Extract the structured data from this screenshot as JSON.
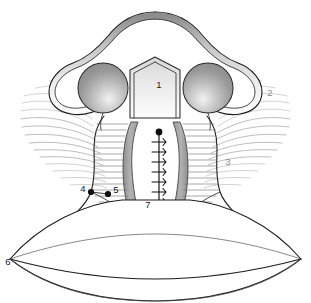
{
  "figure": {
    "background_color": "#ffffff",
    "width": 311,
    "height": 303,
    "view": "coronal / frontal schematic",
    "line_color": "#1c1c1c",
    "fill_white": "#ffffff",
    "fill_gray_band": "#a8a8a8",
    "fill_gray_lobe": "#9c9c9c",
    "striation_color": "#9a9a9a",
    "faint_label_color": "#8c8c8c"
  },
  "callouts": [
    {
      "id": "1",
      "label": "1",
      "x": 159,
      "y": 85,
      "style": "dark",
      "has_dot": false,
      "has_leader": false,
      "region": "central-pentagon-septum"
    },
    {
      "id": "2",
      "label": "2",
      "x": 270,
      "y": 93,
      "style": "faint",
      "has_dot": false,
      "has_leader": false,
      "region": "right-upper-striations"
    },
    {
      "id": "3",
      "label": "3",
      "x": 228,
      "y": 162,
      "style": "faint",
      "has_dot": false,
      "has_leader": false,
      "region": "right-lower-striations"
    },
    {
      "id": "4",
      "label": "4",
      "x": 83,
      "y": 189,
      "style": "dark",
      "has_dot": true,
      "dot_x": 91,
      "dot_y": 192,
      "has_leader": true,
      "region": "left-junction-point"
    },
    {
      "id": "5",
      "label": "5",
      "x": 116,
      "y": 190,
      "style": "dark",
      "has_dot": true,
      "dot_x": 108,
      "dot_y": 194,
      "has_leader": true,
      "region": "medial-junction-point"
    },
    {
      "id": "6",
      "label": "6",
      "x": 8,
      "y": 262,
      "style": "dark",
      "has_dot": false,
      "has_leader": false,
      "region": "left-lens-vertex"
    },
    {
      "id": "7",
      "label": "7",
      "x": 148,
      "y": 205,
      "style": "dark",
      "has_dot": false,
      "has_leader": false,
      "region": "suture-column"
    }
  ],
  "structures": [
    {
      "name": "upper-bell-outline",
      "description": "mushroom / bell shaped outer contour with shaded rim"
    },
    {
      "name": "bell-inner-rim",
      "description": "gray gradient band inside bell outline"
    },
    {
      "name": "left-lobe",
      "description": "gray shaded circular lobe, left"
    },
    {
      "name": "right-lobe",
      "description": "gray shaded circular lobe, right"
    },
    {
      "name": "central-septum",
      "description": "pentagon shaped central column containing label 1"
    },
    {
      "name": "left-gray-band",
      "description": "vertical gray band left of midline"
    },
    {
      "name": "right-gray-band",
      "description": "vertical gray band right of midline"
    },
    {
      "name": "suture-column",
      "description": "vertical stitched line with barbs and terminal knot"
    },
    {
      "name": "left-striations",
      "description": "fan of curved gray lines radiating left"
    },
    {
      "name": "right-striations",
      "description": "fan of curved gray lines radiating right"
    },
    {
      "name": "lower-lens-body",
      "description": "wide lens / leaf shaped lower structure"
    }
  ],
  "suture": {
    "knot_x": 159,
    "knot_y": 132,
    "knot_radius": 3.4,
    "top_y": 136,
    "bottom_y": 216,
    "barb_count": 8,
    "barb_spacing": 10
  }
}
